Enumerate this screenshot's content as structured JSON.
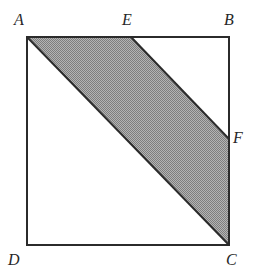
{
  "figure": {
    "background_color": "#ffffff",
    "stroke_color": "#2b2b2b",
    "shade_color": "#9a9a9a",
    "shade_pattern": "checkerboard-dither",
    "label_color": "#272727",
    "square": {
      "name": "ABCD",
      "vertices": [
        {
          "id": "A",
          "label": "A",
          "x": 27,
          "y": 37,
          "label_x": 14,
          "label_y": 12,
          "position": "top-left"
        },
        {
          "id": "B",
          "label": "B",
          "x": 229,
          "y": 37,
          "label_x": 224,
          "label_y": 12,
          "position": "top-right"
        },
        {
          "id": "C",
          "label": "C",
          "x": 229,
          "y": 245,
          "label_x": 226,
          "label_y": 252,
          "position": "bottom-right"
        },
        {
          "id": "D",
          "label": "D",
          "x": 27,
          "y": 245,
          "label_x": 8,
          "label_y": 252,
          "position": "bottom-left"
        }
      ]
    },
    "points_on_edges": [
      {
        "id": "E",
        "label": "E",
        "x": 131,
        "y": 37,
        "label_x": 122,
        "label_y": 12,
        "on_edge": "AB"
      },
      {
        "id": "F",
        "label": "F",
        "x": 229,
        "y": 139,
        "label_x": 233,
        "label_y": 130,
        "on_edge": "BC"
      }
    ],
    "shaded_region": {
      "name": "AEFC",
      "polygon": "27,37 131,37 229,139 229,245",
      "fill": "#9a9a9a"
    },
    "segments": [
      {
        "id": "AB",
        "from": "A",
        "to": "B"
      },
      {
        "id": "BC",
        "from": "B",
        "to": "C"
      },
      {
        "id": "CD",
        "from": "C",
        "to": "D"
      },
      {
        "id": "DA",
        "from": "D",
        "to": "A"
      },
      {
        "id": "AC",
        "from": "A",
        "to": "C"
      },
      {
        "id": "EF",
        "from": "E",
        "to": "F"
      }
    ]
  }
}
